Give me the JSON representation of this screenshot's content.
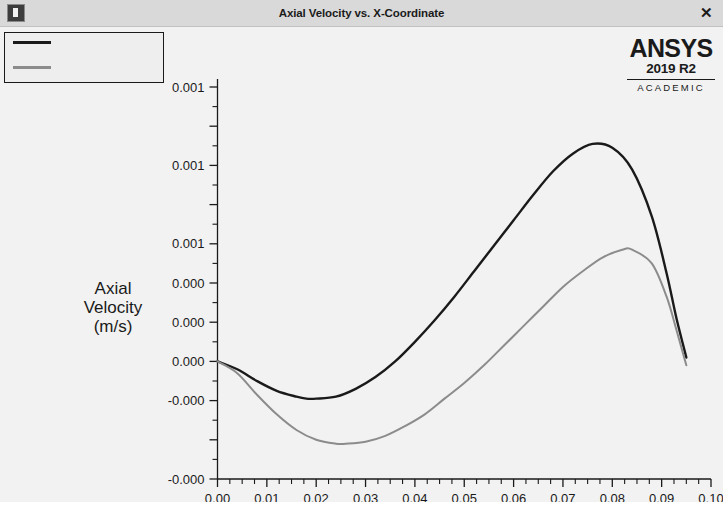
{
  "window": {
    "title": "Axial Velocity vs. X-Coordinate",
    "icon": "window-icon",
    "close_label": "✕"
  },
  "branding": {
    "wordmark": "ANSYS",
    "release": "2019 R2",
    "edition": "ACADEMIC"
  },
  "legend": {
    "entries": [
      {
        "label": "",
        "color": "#1a1a1a"
      },
      {
        "label": "",
        "color": "#8c8c8c"
      }
    ]
  },
  "axes": {
    "y_title_lines": [
      "Axial",
      "Velocity",
      "(m/s)"
    ],
    "x_title": "X-Coordinate (m)",
    "y_tick_labels": [
      "0.001",
      "0.001",
      "0.001",
      "0.000",
      "0.000",
      "0.000",
      "-0.000",
      "-0.000"
    ],
    "x_tick_labels": [
      "0.00",
      "0.01",
      "0.02",
      "0.03",
      "0.04",
      "0.05",
      "0.06",
      "0.07",
      "0.08",
      "0.09",
      "0.10"
    ]
  },
  "caption": {
    "text": ""
  },
  "colors": {
    "series_primary": "#1a1a1a",
    "series_secondary": "#8c8c8c",
    "plot_background": "#f2f2f2",
    "titlebar_background": "#d9d9d9",
    "text": "#1a1a1a"
  },
  "chart_data": {
    "type": "line",
    "title": "Axial Velocity vs. X-Coordinate",
    "xlabel": "X-Coordinate (m)",
    "ylabel": "Axial Velocity (m/s)",
    "xlim": [
      0.0,
      0.1
    ],
    "ylim": [
      -0.0006,
      0.0014
    ],
    "xticks": [
      0.0,
      0.01,
      0.02,
      0.03,
      0.04,
      0.05,
      0.06,
      0.07,
      0.08,
      0.09,
      0.1
    ],
    "xtick_labels": [
      "0.00",
      "0.01",
      "0.02",
      "0.03",
      "0.04",
      "0.05",
      "0.06",
      "0.07",
      "0.08",
      "0.09",
      "0.10"
    ],
    "yticks": [
      0.0014,
      0.0012,
      0.001,
      0.0008,
      0.0006,
      0.0004,
      0.0002,
      0.0,
      -0.0002,
      -0.0004,
      -0.0006
    ],
    "ytick_labels_shown": [
      "0.001",
      "0.001",
      "0.001",
      "0.000",
      "0.000",
      "0.000",
      "-0.000",
      "-0.000"
    ],
    "grid": false,
    "legend_position": "top-left",
    "minor_ticks": true,
    "series": [
      {
        "name": "series-1",
        "color": "#1a1a1a",
        "x": [
          0.0,
          0.004,
          0.008,
          0.012,
          0.016,
          0.018,
          0.02,
          0.024,
          0.028,
          0.032,
          0.036,
          0.04,
          0.044,
          0.048,
          0.052,
          0.056,
          0.06,
          0.064,
          0.068,
          0.072,
          0.076,
          0.08,
          0.084,
          0.088,
          0.091,
          0.093,
          0.095
        ],
        "y": [
          0.0,
          -4e-05,
          -0.0001,
          -0.00015,
          -0.00018,
          -0.00019,
          -0.00019,
          -0.00018,
          -0.00014,
          -8e-05,
          0.0,
          0.0001,
          0.00021,
          0.00033,
          0.00046,
          0.00059,
          0.00072,
          0.00085,
          0.00097,
          0.00106,
          0.00111,
          0.00109,
          0.00098,
          0.00074,
          0.00045,
          0.00022,
          2e-05
        ]
      },
      {
        "name": "series-2",
        "color": "#8c8c8c",
        "x": [
          0.0,
          0.004,
          0.008,
          0.012,
          0.016,
          0.02,
          0.024,
          0.026,
          0.03,
          0.034,
          0.038,
          0.042,
          0.046,
          0.05,
          0.054,
          0.058,
          0.062,
          0.066,
          0.07,
          0.074,
          0.078,
          0.082,
          0.084,
          0.088,
          0.091,
          0.093,
          0.095
        ],
        "y": [
          0.0,
          -6e-05,
          -0.00017,
          -0.00027,
          -0.00035,
          -0.0004,
          -0.00042,
          -0.00042,
          -0.00041,
          -0.00038,
          -0.00033,
          -0.00027,
          -0.00019,
          -0.00011,
          -2e-05,
          8e-05,
          0.00018,
          0.00028,
          0.00038,
          0.00046,
          0.00053,
          0.00057,
          0.00057,
          0.0005,
          0.00033,
          0.00016,
          -2e-05
        ]
      }
    ]
  }
}
